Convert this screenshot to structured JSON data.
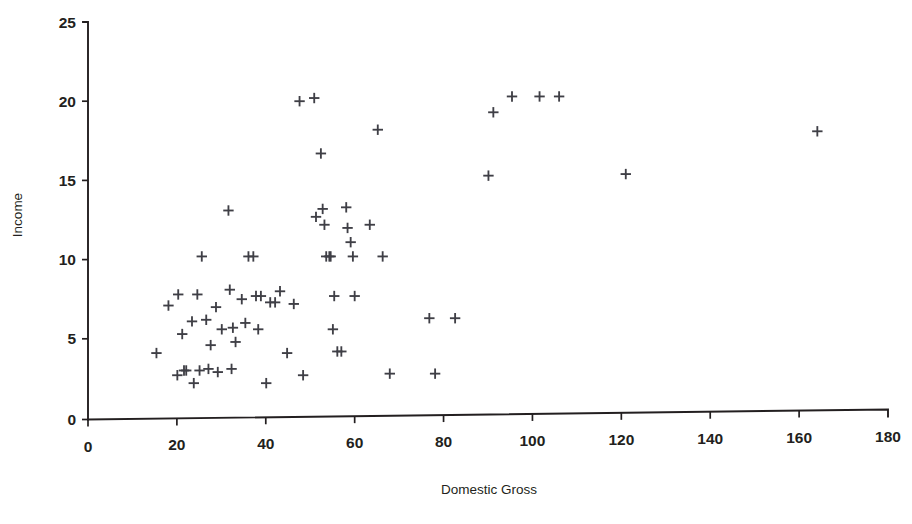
{
  "chart_data": {
    "type": "scatter",
    "title": "",
    "xlabel": "Domestic Gross",
    "ylabel": "Income",
    "xlim": [
      0,
      180
    ],
    "ylim": [
      0,
      25
    ],
    "xticks": [
      0,
      20,
      40,
      60,
      80,
      100,
      120,
      140,
      160,
      180
    ],
    "yticks": [
      0,
      5,
      10,
      15,
      20,
      25
    ],
    "xtick_labels": [
      "0",
      "20",
      "40",
      "60",
      "80",
      "100",
      "120",
      "140",
      "160",
      "180"
    ],
    "ytick_labels": [
      "0",
      "5",
      "10",
      "15",
      "20",
      "25"
    ],
    "grid": false,
    "legend": null,
    "marker": "plus",
    "marker_color": "#3f3f46",
    "series": [
      {
        "name": "Movies",
        "points": [
          [
            15.4,
            4.1
          ],
          [
            18.1,
            7.1
          ],
          [
            20.1,
            2.7
          ],
          [
            20.3,
            7.8
          ],
          [
            21.2,
            5.3
          ],
          [
            21.6,
            3.0
          ],
          [
            22.1,
            3.0
          ],
          [
            23.4,
            6.1
          ],
          [
            23.8,
            2.2
          ],
          [
            24.6,
            7.8
          ],
          [
            25.1,
            3.0
          ],
          [
            25.6,
            10.2
          ],
          [
            26.6,
            6.2
          ],
          [
            27.1,
            3.1
          ],
          [
            27.6,
            4.6
          ],
          [
            28.8,
            7.0
          ],
          [
            29.2,
            2.9
          ],
          [
            30.1,
            5.6
          ],
          [
            31.6,
            13.1
          ],
          [
            31.9,
            8.1
          ],
          [
            32.3,
            3.1
          ],
          [
            32.6,
            5.7
          ],
          [
            33.2,
            4.8
          ],
          [
            34.6,
            7.5
          ],
          [
            35.4,
            6.0
          ],
          [
            36.1,
            10.2
          ],
          [
            37.2,
            10.2
          ],
          [
            37.8,
            7.7
          ],
          [
            38.3,
            5.6
          ],
          [
            38.9,
            7.7
          ],
          [
            40.1,
            2.2
          ],
          [
            41.0,
            7.3
          ],
          [
            42.1,
            7.3
          ],
          [
            43.2,
            8.0
          ],
          [
            44.8,
            4.1
          ],
          [
            46.3,
            7.2
          ],
          [
            47.6,
            20.0
          ],
          [
            48.4,
            2.7
          ],
          [
            50.9,
            20.2
          ],
          [
            51.3,
            12.7
          ],
          [
            52.4,
            16.7
          ],
          [
            52.8,
            13.2
          ],
          [
            53.2,
            12.2
          ],
          [
            53.6,
            10.2
          ],
          [
            54.3,
            10.2
          ],
          [
            54.6,
            10.2
          ],
          [
            55.1,
            5.6
          ],
          [
            55.4,
            7.7
          ],
          [
            56.1,
            4.2
          ],
          [
            57.0,
            4.2
          ],
          [
            58.1,
            13.3
          ],
          [
            58.4,
            12.0
          ],
          [
            59.1,
            11.1
          ],
          [
            59.6,
            10.2
          ],
          [
            60.0,
            7.7
          ],
          [
            63.4,
            12.2
          ],
          [
            65.2,
            18.2
          ],
          [
            66.3,
            10.2
          ],
          [
            67.9,
            2.8
          ],
          [
            76.8,
            6.3
          ],
          [
            78.1,
            2.8
          ],
          [
            82.6,
            6.3
          ],
          [
            90.1,
            15.3
          ],
          [
            91.2,
            19.3
          ],
          [
            95.4,
            20.3
          ],
          [
            101.6,
            20.3
          ],
          [
            106.0,
            20.3
          ],
          [
            121.0,
            15.4
          ],
          [
            164.1,
            18.1
          ]
        ]
      }
    ]
  },
  "axes": {
    "x_axis_name": "Domestic Gross",
    "y_axis_name": "Income"
  }
}
